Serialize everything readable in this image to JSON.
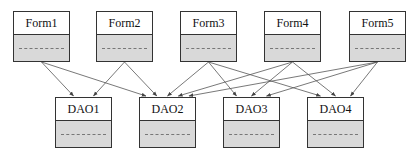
{
  "diagram": {
    "type": "dependency-diagram",
    "top_row": [
      {
        "id": "form1",
        "label": "Form1",
        "x": 13,
        "y": 11,
        "w": 57,
        "h": 51
      },
      {
        "id": "form2",
        "label": "Form2",
        "x": 96,
        "y": 11,
        "w": 57,
        "h": 51
      },
      {
        "id": "form3",
        "label": "Form3",
        "x": 180,
        "y": 11,
        "w": 57,
        "h": 51
      },
      {
        "id": "form4",
        "label": "Form4",
        "x": 264,
        "y": 11,
        "w": 57,
        "h": 51
      },
      {
        "id": "form5",
        "label": "Form5",
        "x": 349,
        "y": 11,
        "w": 57,
        "h": 51
      }
    ],
    "bottom_row": [
      {
        "id": "dao1",
        "label": "DAO1",
        "x": 55,
        "y": 97,
        "w": 57,
        "h": 51
      },
      {
        "id": "dao2",
        "label": "DAO2",
        "x": 139,
        "y": 97,
        "w": 57,
        "h": 51
      },
      {
        "id": "dao3",
        "label": "DAO3",
        "x": 223,
        "y": 97,
        "w": 57,
        "h": 51
      },
      {
        "id": "dao4",
        "label": "DAO4",
        "x": 307,
        "y": 97,
        "w": 57,
        "h": 51
      }
    ],
    "edges": [
      {
        "from": "form1",
        "to": "dao1"
      },
      {
        "from": "form1",
        "to": "dao2"
      },
      {
        "from": "form2",
        "to": "dao1"
      },
      {
        "from": "form2",
        "to": "dao2"
      },
      {
        "from": "form3",
        "to": "dao2"
      },
      {
        "from": "form3",
        "to": "dao3"
      },
      {
        "from": "form3",
        "to": "dao4"
      },
      {
        "from": "form4",
        "to": "dao2"
      },
      {
        "from": "form4",
        "to": "dao3"
      },
      {
        "from": "form4",
        "to": "dao4"
      },
      {
        "from": "form5",
        "to": "dao2"
      },
      {
        "from": "form5",
        "to": "dao3"
      },
      {
        "from": "form5",
        "to": "dao4"
      }
    ],
    "colors": {
      "border": "#333333",
      "title_bg": "#ffffff",
      "body_bg": "#d9d9d9",
      "edge": "#555555"
    }
  }
}
